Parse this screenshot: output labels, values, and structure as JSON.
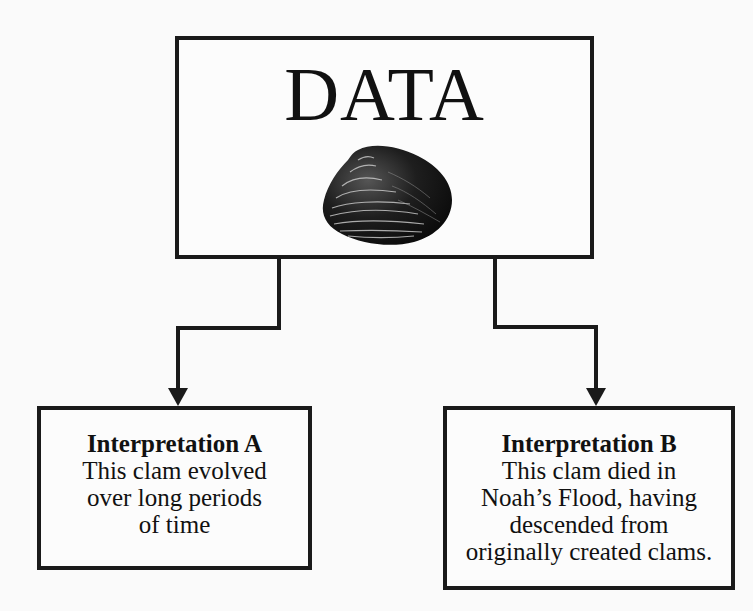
{
  "diagram": {
    "data_box": {
      "title": "DATA",
      "image": "clam-shell-icon"
    },
    "interpretation_a": {
      "title": "Interpretation A",
      "lines": [
        "This clam evolved",
        "over long periods",
        "of time"
      ]
    },
    "interpretation_b": {
      "title": "Interpretation B",
      "lines": [
        "This clam died in",
        "Noah’s Flood, having",
        "descended from",
        "originally created clams."
      ]
    },
    "connectors": [
      {
        "from": "DATA",
        "to": "Interpretation A",
        "type": "arrow"
      },
      {
        "from": "DATA",
        "to": "Interpretation B",
        "type": "arrow"
      }
    ],
    "colors": {
      "line": "#1a1a1a",
      "background": "#fafafa",
      "text": "#111111"
    }
  }
}
